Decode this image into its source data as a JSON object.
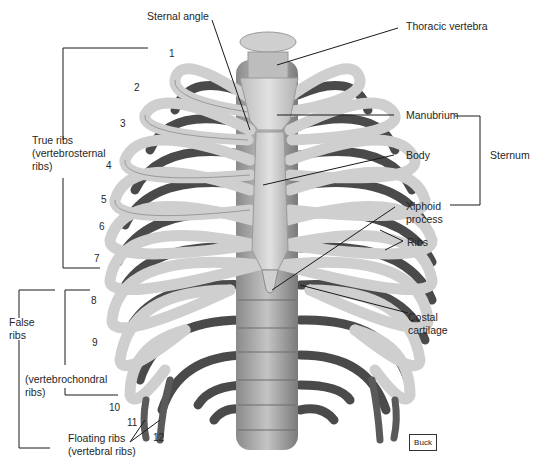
{
  "diagram": {
    "type": "anatomical-illustration",
    "colors": {
      "bone_light": "#d9d9d9",
      "bone_mid": "#a8a8a8",
      "bone_dark": "#4a4a4a",
      "leader_line": "#1a1a1a",
      "background": "#ffffff"
    }
  },
  "labels": {
    "sternal_angle": "Sternal angle",
    "thoracic_vertebra": "Thoracic vertebra",
    "manubrium": "Manubrium",
    "body": "Body",
    "xiphoid_process": "Xiphoid\nprocess",
    "sternum": "Sternum",
    "ribs": "Ribs",
    "costal_cartilage": "Costal\ncartilage",
    "true_ribs": "True ribs\n(vertebrosternal\nribs)",
    "false_ribs": "False\nribs",
    "vertebrochondral_ribs": "(vertebrochondral\nribs)",
    "floating_ribs": "Floating ribs\n(vertebral ribs)"
  },
  "rib_numbers": [
    "1",
    "2",
    "3",
    "4",
    "5",
    "6",
    "7",
    "8",
    "9",
    "10",
    "11",
    "12"
  ],
  "credit": "Buck"
}
